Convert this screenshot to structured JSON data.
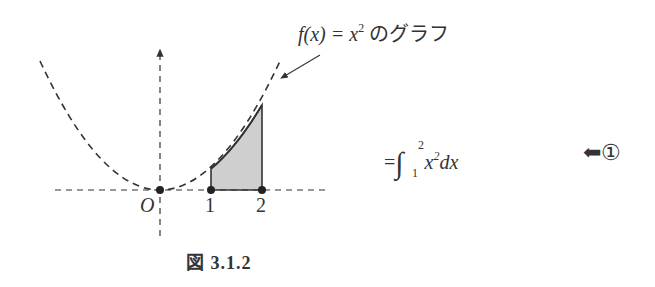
{
  "figure": {
    "function_label": {
      "prefix": "f(x) = x",
      "exponent": "2",
      "suffix": " のグラフ"
    },
    "origin_label": "O",
    "ticks": [
      "1",
      "2"
    ],
    "caption": "図 3.1.2",
    "curve": "y = x^2",
    "shaded_interval": [
      1,
      2
    ]
  },
  "equation": {
    "equals": "=",
    "integral_sign": "∫",
    "upper_limit": "2",
    "lower_limit": "1",
    "integrand_base": "x",
    "integrand_exponent": "2",
    "differential": "dx"
  },
  "marker": {
    "arrow": "⬅",
    "number": "①"
  },
  "colors": {
    "ink": "#333333",
    "shade": "#cfcfcf",
    "background": "#ffffff"
  }
}
